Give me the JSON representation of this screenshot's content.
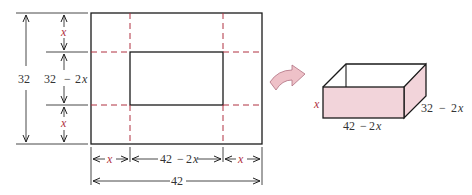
{
  "diagram": {
    "sheet": {
      "width_label": "42",
      "height_label": "32",
      "corner_label": "x",
      "middle_height_label": "32 − 2x",
      "middle_width_label": "42 − 2x"
    },
    "box": {
      "height_label": "x",
      "length_label": "42 − 2x",
      "width_label": "32 − 2x"
    },
    "colors": {
      "outline": "#1a1a1a",
      "cut_line": "#b03040",
      "box_fill": "#f2d4da",
      "arrow_fill": "#eec1c8"
    },
    "labels": {
      "total_height": "32",
      "total_width": "42",
      "top_x": "x",
      "bottom_x": "x",
      "left_x": "x",
      "right_x": "x",
      "mid_h_a": "32",
      "mid_h_op": "−",
      "mid_h_b": "2",
      "mid_h_var": "x",
      "mid_w_a": "42",
      "mid_w_op": "−",
      "mid_w_b": "2",
      "mid_w_var": "x",
      "box_h": "x",
      "box_l_a": "42",
      "box_l_op": "−",
      "box_l_b": "2",
      "box_l_var": "x",
      "box_w_a": "32",
      "box_w_op": "−",
      "box_w_b": "2",
      "box_w_var": "x"
    }
  }
}
